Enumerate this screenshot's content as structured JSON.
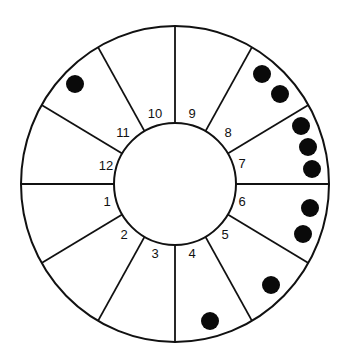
{
  "diagram": {
    "type": "sectored-wheel",
    "center": [
      175,
      184
    ],
    "outer_radius": [
      154,
      158
    ],
    "inner_radius": 61,
    "colors": {
      "stroke": "#111111",
      "fill": "#ffffff",
      "dot": "#0a0a0a"
    },
    "sectors": [
      {
        "label": "1",
        "label_pos": [
          107,
          203
        ],
        "dot_count": 0,
        "dots": []
      },
      {
        "label": "2",
        "label_pos": [
          124,
          236
        ],
        "dot_count": 0,
        "dots": []
      },
      {
        "label": "3",
        "label_pos": [
          155,
          255
        ],
        "dot_count": 0,
        "dots": []
      },
      {
        "label": "4",
        "label_pos": [
          192,
          255
        ],
        "dot_count": 1,
        "dots": [
          [
            210,
            321
          ]
        ]
      },
      {
        "label": "5",
        "label_pos": [
          225,
          236
        ],
        "dot_count": 1,
        "dots": [
          [
            271,
            285
          ]
        ]
      },
      {
        "label": "6",
        "label_pos": [
          242,
          203
        ],
        "dot_count": 2,
        "dots": [
          [
            310,
            208
          ],
          [
            303,
            234
          ]
        ]
      },
      {
        "label": "7",
        "label_pos": [
          242,
          165
        ],
        "dot_count": 3,
        "dots": [
          [
            301,
            126
          ],
          [
            308,
            147
          ],
          [
            312,
            169
          ]
        ]
      },
      {
        "label": "8",
        "label_pos": [
          228,
          134
        ],
        "dot_count": 2,
        "dots": [
          [
            262,
            74
          ],
          [
            280,
            94
          ]
        ]
      },
      {
        "label": "9",
        "label_pos": [
          192,
          115
        ],
        "dot_count": 0,
        "dots": []
      },
      {
        "label": "10",
        "label_pos": [
          155,
          115
        ],
        "dot_count": 0,
        "dots": []
      },
      {
        "label": "11",
        "label_pos": [
          123,
          134
        ],
        "dot_count": 1,
        "dots": [
          [
            75,
            84
          ]
        ]
      },
      {
        "label": "12",
        "label_pos": [
          106,
          167
        ],
        "dot_count": 0,
        "dots": []
      }
    ]
  }
}
